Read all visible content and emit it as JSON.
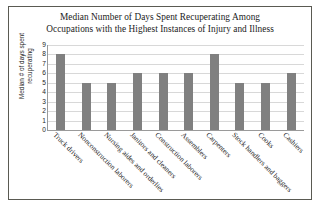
{
  "chart_data": {
    "type": "bar",
    "title": "Median Number of Days Spent Recuperating Among Occupations with the Highest Instances of Injury and Illness",
    "title_lines": [
      "Median Number of Days Spent Recuperating Among",
      "Occupations with the Highest Instances of Injury and Illness"
    ],
    "xlabel": "",
    "ylabel": "Median # of days spent recuperating",
    "ylabel_lines": [
      "Median # of days spent",
      "recuperating"
    ],
    "categories": [
      "Truck drivers",
      "Nonconstruction laborers",
      "Nursing aides and orderlies",
      "Janitors and cleaners",
      "Construction laborers",
      "Assemblers",
      "Carpenters",
      "Stock handlers and baggers",
      "Cooks",
      "Cashiers"
    ],
    "values": [
      8,
      5,
      5,
      6,
      6,
      6,
      8,
      5,
      5,
      6
    ],
    "ylim": [
      0,
      9
    ],
    "ytick_labels": [
      "9",
      "8",
      "7",
      "6",
      "5",
      "4",
      "3",
      "2",
      "1",
      "0"
    ],
    "ytick_values": [
      9,
      8,
      7,
      6,
      5,
      4,
      3,
      2,
      1,
      0
    ],
    "grid": true,
    "legend": false,
    "bar_color": "#808080",
    "grid_color": "#d8d8d8",
    "axis_color": "#9a9a9a",
    "border_color": "#5a5a52",
    "background_color": "#ffffff"
  }
}
